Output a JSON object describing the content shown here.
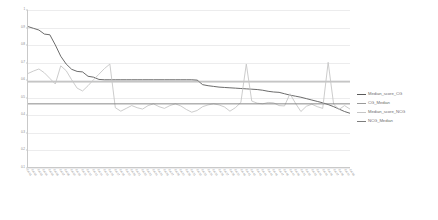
{
  "chart_data": {
    "type": "line",
    "title": "",
    "xlabel": "",
    "ylabel": "",
    "ylim": [
      0.1,
      1.0
    ],
    "yticks": [
      "1",
      "0.9",
      "0.8",
      "0.7",
      "0.6",
      "0.5",
      "0.4",
      "0.3",
      "0.2",
      "0.1"
    ],
    "grid": true,
    "legend_position": "right",
    "colors": {
      "median_score_cg": "#5a5a5a",
      "cg_median": "#9a9a9a",
      "median_score_ncg": "#c6c6c6",
      "ncg_median": "#7d7d7d",
      "gridline": "#ececed",
      "axis": "#c9c9c9",
      "text": "#8a8a8a"
    },
    "categories": [
      "Cat 01",
      "Cat 02",
      "Cat 03",
      "Cat 04",
      "Cat 05",
      "Cat 06",
      "Cat 07",
      "Cat 08",
      "Cat 09",
      "Cat 10",
      "Cat 11",
      "Cat 12",
      "Cat 13",
      "Cat 14",
      "Cat 15",
      "Cat 16",
      "Cat 17",
      "Cat 18",
      "Cat 19",
      "Cat 20",
      "Cat 21",
      "Cat 22",
      "Cat 23",
      "Cat 24",
      "Cat 25",
      "Cat 26",
      "Cat 27",
      "Cat 28",
      "Cat 29",
      "Cat 30",
      "Cat 31",
      "Cat 32",
      "Cat 33",
      "Cat 34",
      "Cat 35",
      "Cat 36",
      "Cat 37",
      "Cat 38",
      "Cat 39",
      "Cat 40",
      "Cat 41",
      "Cat 42",
      "Cat 43",
      "Cat 44",
      "Cat 45",
      "Cat 46",
      "Cat 47",
      "Cat 48",
      "Cat 49",
      "Cat 50",
      "Cat 51",
      "Cat 52",
      "Cat 53",
      "Cat 54",
      "Cat 55",
      "Cat 56",
      "Cat 57",
      "Cat 58",
      "Cat 59",
      "Cat 60"
    ],
    "series": [
      {
        "name": "Median_score_CG",
        "type": "line",
        "color": "#5a5a5a",
        "values": [
          0.905,
          0.895,
          0.885,
          0.862,
          0.858,
          0.8,
          0.735,
          0.69,
          0.66,
          0.648,
          0.645,
          0.62,
          0.615,
          0.602,
          0.6,
          0.6,
          0.6,
          0.6,
          0.6,
          0.6,
          0.6,
          0.6,
          0.6,
          0.6,
          0.6,
          0.6,
          0.6,
          0.6,
          0.6,
          0.6,
          0.6,
          0.598,
          0.572,
          0.566,
          0.562,
          0.558,
          0.556,
          0.554,
          0.552,
          0.55,
          0.548,
          0.546,
          0.544,
          0.54,
          0.534,
          0.53,
          0.528,
          0.52,
          0.512,
          0.506,
          0.5,
          0.492,
          0.484,
          0.476,
          0.468,
          0.458,
          0.446,
          0.432,
          0.418,
          0.408
        ]
      },
      {
        "name": "CG_Median",
        "type": "reference-line",
        "color": "#9a9a9a",
        "value": 0.588
      },
      {
        "name": "Median_score_NCG",
        "type": "line",
        "color": "#c6c6c6",
        "values": [
          0.636,
          0.65,
          0.662,
          0.64,
          0.608,
          0.576,
          0.68,
          0.652,
          0.6,
          0.552,
          0.536,
          0.566,
          0.6,
          0.632,
          0.664,
          0.69,
          0.44,
          0.42,
          0.436,
          0.452,
          0.44,
          0.432,
          0.452,
          0.462,
          0.446,
          0.436,
          0.452,
          0.462,
          0.45,
          0.43,
          0.414,
          0.424,
          0.446,
          0.456,
          0.462,
          0.456,
          0.444,
          0.42,
          0.44,
          0.47,
          0.69,
          0.478,
          0.466,
          0.462,
          0.47,
          0.468,
          0.452,
          0.45,
          0.52,
          0.466,
          0.418,
          0.448,
          0.46,
          0.446,
          0.436,
          0.7,
          0.46,
          0.43,
          0.452,
          0.432
        ]
      },
      {
        "name": "NCG_Median",
        "type": "reference-line",
        "color": "#7d7d7d",
        "value": 0.462
      }
    ]
  },
  "legend": {
    "items": [
      {
        "label": "Median_score_CG",
        "color": "#5a5a5a"
      },
      {
        "label": "CG_Median",
        "color": "#9a9a9a"
      },
      {
        "label": "Median_score_NCG",
        "color": "#c6c6c6"
      },
      {
        "label": "NCG_Median",
        "color": "#7d7d7d"
      }
    ]
  }
}
